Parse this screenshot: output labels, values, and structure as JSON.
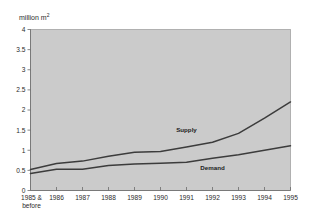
{
  "chart_data": {
    "type": "line",
    "title": "",
    "subtitle": "",
    "ylabel": "million m",
    "ylabel_sup": "2",
    "ylabel_full": "million m2",
    "xlabel": "",
    "ylim": [
      0,
      4
    ],
    "yticks": [
      "0",
      "0.5",
      "1",
      "1.5",
      "2",
      "2.5",
      "3",
      "3.5",
      "4"
    ],
    "ytick_values": [
      0,
      0.5,
      1,
      1.5,
      2,
      2.5,
      3,
      3.5,
      4
    ],
    "categories": [
      "1985 & before",
      "1986",
      "1987",
      "1988",
      "1989",
      "1990",
      "1991",
      "1992",
      "1993",
      "1994",
      "1995"
    ],
    "category_lines": [
      [
        "1985 &",
        "before"
      ],
      [
        "1986"
      ],
      [
        "1987"
      ],
      [
        "1988"
      ],
      [
        "1989"
      ],
      [
        "1990"
      ],
      [
        "1991"
      ],
      [
        "1992"
      ],
      [
        "1993"
      ],
      [
        "1994"
      ],
      [
        "1995"
      ]
    ],
    "grid": false,
    "legend": "inline-labels",
    "series": [
      {
        "name": "Supply",
        "label": "Supply",
        "color": "#3c3c3c",
        "values": [
          0.52,
          0.67,
          0.73,
          0.85,
          0.95,
          0.97,
          1.08,
          1.2,
          1.42,
          1.8,
          2.2
        ],
        "label_x_category": "1991",
        "label_value": 1.45
      },
      {
        "name": "Demand",
        "label": "Demand",
        "color": "#3c3c3c",
        "values": [
          0.42,
          0.53,
          0.53,
          0.62,
          0.66,
          0.68,
          0.7,
          0.8,
          0.89,
          1.0,
          1.11
        ],
        "label_x_category": "1992",
        "label_value": 0.52
      }
    ],
    "plot_background": "#cbcbcb",
    "page_background": "#ffffff",
    "axis_color": "#6b6b6b",
    "line_color": "#3c3c3c"
  }
}
